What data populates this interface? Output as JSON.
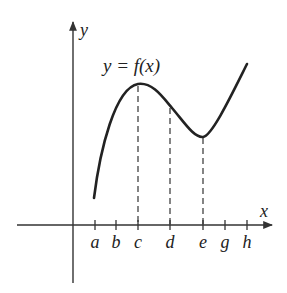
{
  "diagram": {
    "function_label": "y = f(x)",
    "axes": {
      "x_label": "x",
      "y_label": "y"
    },
    "ticks": [
      {
        "label": "a",
        "x": 95,
        "dashed": false
      },
      {
        "label": "b",
        "x": 116,
        "dashed": false
      },
      {
        "label": "c",
        "x": 138,
        "dashed": true
      },
      {
        "label": "d",
        "x": 170,
        "dashed": true
      },
      {
        "label": "e",
        "x": 203,
        "dashed": true
      },
      {
        "label": "g",
        "x": 225,
        "dashed": false
      },
      {
        "label": "h",
        "x": 247,
        "dashed": false
      }
    ],
    "curve_notes": {
      "local_max_at": "c",
      "local_min_at": "e",
      "start_at": "a",
      "end_at": "h"
    },
    "colors": {
      "stroke": "#222222",
      "axis": "#333333",
      "background": "#ffffff"
    }
  }
}
